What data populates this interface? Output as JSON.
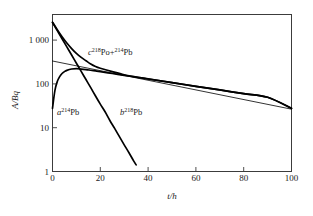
{
  "chart_data": {
    "type": "line",
    "title": "",
    "xlabel": "t/h",
    "ylabel": "A/Bq",
    "xlim": [
      0,
      100
    ],
    "ylim": [
      1,
      3000
    ],
    "yscale": "log",
    "grid": false,
    "legend_position": "inline-annotations",
    "xticks": [
      0,
      20,
      40,
      60,
      80,
      100
    ],
    "xtick_labels": [
      "0",
      "20",
      "40",
      "60",
      "80",
      "100"
    ],
    "yticks": [
      1,
      10,
      100,
      1000
    ],
    "ytick_labels": [
      "1",
      "10",
      "100",
      "1 000"
    ],
    "annotations": [
      {
        "key": "curve_a",
        "prefix": "a",
        "mass": "214",
        "element": "Pb",
        "text": "a 214Pb",
        "x_pct": 17.6,
        "y_pct": 50.3
      },
      {
        "key": "curve_b",
        "prefix": "b",
        "mass": "218",
        "element": "Pb",
        "text": "b 218Pb",
        "x_pct": 37.8,
        "y_pct": 50.3
      },
      {
        "key": "curve_c",
        "prefix": "c",
        "mass1": "218",
        "element1": "Po",
        "plus": "+",
        "mass2": "214",
        "element2": "Pb",
        "text": "c 218Po+214Pb",
        "x_pct": 27.5,
        "y_pct": 23.5
      }
    ],
    "series": [
      {
        "name": "a 214Pb",
        "style": "thin",
        "x": [
          0,
          1,
          2,
          3,
          4,
          5,
          6,
          8,
          10,
          12,
          14,
          16,
          18,
          20,
          25,
          30,
          35,
          40,
          50,
          60,
          70,
          80,
          90,
          100
        ],
        "y": [
          25,
          62,
          98,
          126,
          148,
          163,
          174,
          186,
          189,
          186,
          181,
          175,
          169,
          163,
          148,
          135,
          123,
          112,
          93,
          77,
          64,
          53,
          44,
          25
        ]
      },
      {
        "name": "b 218Pb",
        "style": "thick",
        "x": [
          0,
          2,
          4,
          6,
          8,
          10,
          12,
          14,
          16,
          18,
          20,
          22,
          24,
          26,
          28,
          30,
          32,
          34,
          35
        ],
        "y": [
          2000,
          1320,
          870,
          575,
          380,
          250,
          165,
          109,
          72,
          47,
          31,
          21,
          13.5,
          9.0,
          5.9,
          3.9,
          2.6,
          1.7,
          1.4
        ]
      },
      {
        "name": "c 218Po+214Pb",
        "style": "thick",
        "x": [
          0,
          2,
          4,
          6,
          8,
          10,
          12,
          14,
          16,
          18,
          20,
          25,
          30,
          35,
          40,
          50,
          60,
          70,
          80,
          90,
          100
        ],
        "y": [
          2025,
          1382,
          968,
          701,
          528,
          413,
          337,
          284,
          241,
          212,
          194,
          163,
          139,
          124,
          113,
          93,
          77,
          64,
          53,
          44,
          25
        ]
      },
      {
        "name": "background-line",
        "style": "thin-straight",
        "x": [
          0,
          100
        ],
        "y": [
          280,
          24
        ]
      }
    ]
  }
}
